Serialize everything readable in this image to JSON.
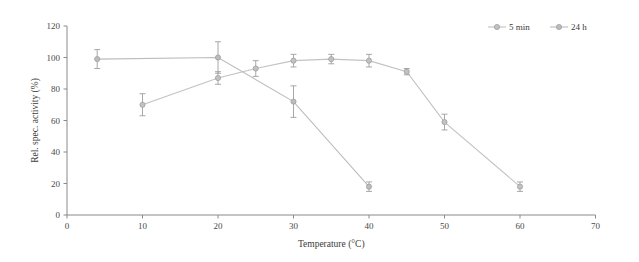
{
  "chart_data": {
    "type": "line",
    "title": "",
    "xlabel": "Temperature (°C)",
    "ylabel": "Rel. spec. activity (%)",
    "xlim": [
      0,
      70
    ],
    "ylim": [
      0,
      120
    ],
    "xticks": [
      0,
      10,
      20,
      30,
      40,
      50,
      60,
      70
    ],
    "yticks": [
      0,
      20,
      40,
      60,
      80,
      100,
      120
    ],
    "grid": false,
    "legend_position": "top-right",
    "series": [
      {
        "name": "5 min",
        "color": "#c2c2c2",
        "marker": "circle",
        "x": [
          10,
          20,
          25,
          30,
          35,
          40,
          45,
          50,
          60
        ],
        "values": [
          70,
          87,
          93,
          98,
          99,
          98,
          91,
          59,
          18
        ],
        "error": [
          7,
          4,
          5,
          4,
          3,
          4,
          2,
          5,
          3
        ]
      },
      {
        "name": "24 h",
        "color": "#bcbcbc",
        "marker": "circle",
        "x": [
          4,
          20,
          30,
          40
        ],
        "values": [
          99,
          100,
          72,
          18
        ],
        "error": [
          6,
          10,
          10,
          3
        ]
      }
    ]
  },
  "legend": {
    "entries": [
      {
        "label": "5 min"
      },
      {
        "label": "24 h"
      }
    ]
  },
  "axis": {
    "x_title": "Temperature (°C)",
    "y_title": "Rel. spec. activity (%)",
    "x_tick_labels": [
      "0",
      "10",
      "20",
      "30",
      "40",
      "50",
      "60",
      "70"
    ],
    "y_tick_labels": [
      "0",
      "20",
      "40",
      "60",
      "80",
      "100",
      "120"
    ]
  },
  "colors": {
    "series_5min": "#c2c2c2",
    "series_24h": "#bcbcbc",
    "axis": "#8a8a8a",
    "text": "#3b3b3b",
    "background": "#ffffff"
  }
}
